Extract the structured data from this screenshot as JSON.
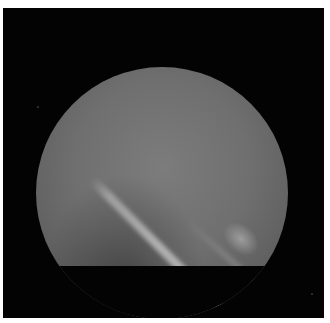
{
  "image": {
    "description": "Grayscale circular endoscopic/fluoroscopic field of view on black background with a bright diagonal streak running from upper-left to lower-right",
    "colors": {
      "border": "#ffffff",
      "background": "#030303",
      "field_center": "#7c7c7c",
      "field_edge": "#4a4a4a",
      "streak": "#d8d8d8"
    }
  }
}
